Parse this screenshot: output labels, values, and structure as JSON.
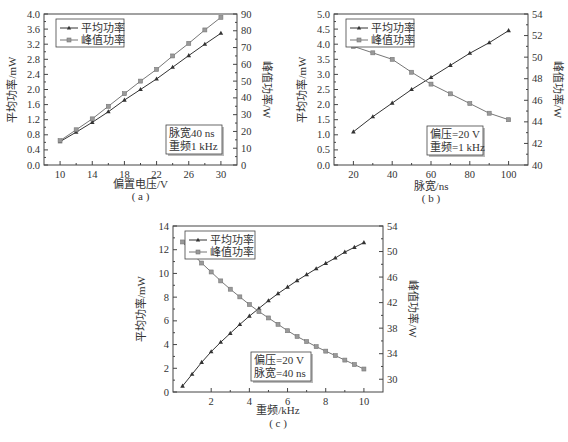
{
  "chart_data": [
    {
      "id": "a",
      "type": "line",
      "caption": "( a )",
      "xlabel": "偏置电压/V",
      "ylabel_left": "平均功率/mW",
      "ylabel_right": "峰值功率/W",
      "xlim": [
        8,
        32
      ],
      "xticks": [
        10,
        14,
        18,
        22,
        26,
        30
      ],
      "ylim_left": [
        0,
        4.0
      ],
      "yticks_left": [
        0.0,
        0.4,
        0.8,
        1.2,
        1.6,
        2.0,
        2.4,
        2.8,
        3.2,
        3.6,
        4.0
      ],
      "ylim_right": [
        0,
        90
      ],
      "yticks_right": [
        0,
        10,
        20,
        30,
        40,
        50,
        60,
        70,
        80,
        90
      ],
      "x": [
        10,
        12,
        14,
        16,
        18,
        20,
        22,
        24,
        26,
        28,
        30
      ],
      "series": [
        {
          "name": "平均功率",
          "axis": "left",
          "marker": "triangle",
          "values": [
            0.62,
            0.87,
            1.13,
            1.41,
            1.72,
            2.0,
            2.28,
            2.59,
            2.9,
            3.2,
            3.49
          ]
        },
        {
          "name": "峰值功率",
          "axis": "right",
          "marker": "square-x",
          "values": [
            14.5,
            21.0,
            27.5,
            35.0,
            42.5,
            50.0,
            57.0,
            65.0,
            72.5,
            80.5,
            88.0
          ]
        }
      ],
      "legend": [
        "平均功率",
        "峰值功率"
      ],
      "legend_position": "upper left",
      "annotation": [
        "脉宽40 ns",
        "重频1 kHz"
      ],
      "grid": false
    },
    {
      "id": "b",
      "type": "line",
      "caption": "( b )",
      "xlabel": "脉宽/ns",
      "ylabel_left": "平均功率/mW",
      "ylabel_right": "峰值功率/W",
      "xlim": [
        10,
        110
      ],
      "xticks": [
        20,
        40,
        60,
        80,
        100
      ],
      "ylim_left": [
        0,
        5.0
      ],
      "yticks_left": [
        0.0,
        0.5,
        1.0,
        1.5,
        2.0,
        2.5,
        3.0,
        3.5,
        4.0,
        4.5,
        5.0
      ],
      "ylim_right": [
        40,
        54
      ],
      "yticks_right": [
        40,
        42,
        44,
        46,
        48,
        50,
        52,
        54
      ],
      "x": [
        20,
        30,
        40,
        50,
        60,
        70,
        80,
        90,
        100
      ],
      "series": [
        {
          "name": "平均功率",
          "axis": "left",
          "marker": "triangle",
          "values": [
            1.1,
            1.6,
            2.05,
            2.5,
            2.9,
            3.3,
            3.7,
            4.05,
            4.45
          ]
        },
        {
          "name": "峰值功率",
          "axis": "right",
          "marker": "square-x",
          "values": [
            51.0,
            50.4,
            49.8,
            48.6,
            47.5,
            46.6,
            45.7,
            44.8,
            44.2
          ]
        }
      ],
      "legend": [
        "平均功率",
        "峰值功率"
      ],
      "legend_position": "upper left",
      "annotation": [
        "偏压=20 V",
        "重频=1 kHz"
      ],
      "grid": false
    },
    {
      "id": "c",
      "type": "line",
      "caption": "( c )",
      "xlabel": "重频/kHz",
      "ylabel_left": "平均功率/mW",
      "ylabel_right": "峰值功率/W",
      "xlim": [
        0,
        11
      ],
      "xticks": [
        2,
        4,
        6,
        8,
        10
      ],
      "ylim_left": [
        0,
        14
      ],
      "yticks_left": [
        0,
        2,
        4,
        6,
        8,
        10,
        12,
        14
      ],
      "ylim_right": [
        28,
        54
      ],
      "yticks_right": [
        30,
        34,
        38,
        42,
        46,
        50,
        54
      ],
      "x": [
        0.5,
        1.0,
        1.5,
        2.0,
        2.5,
        3.0,
        3.5,
        4.0,
        4.5,
        5.0,
        5.5,
        6.0,
        6.5,
        7.0,
        7.5,
        8.0,
        8.5,
        9.0,
        9.5,
        10.0
      ],
      "series": [
        {
          "name": "平均功率",
          "axis": "left",
          "marker": "triangle",
          "values": [
            0.5,
            1.5,
            2.5,
            3.4,
            4.2,
            4.95,
            5.7,
            6.4,
            7.05,
            7.7,
            8.3,
            8.85,
            9.4,
            9.9,
            10.4,
            10.85,
            11.3,
            11.8,
            12.2,
            12.6
          ]
        },
        {
          "name": "峰值功率",
          "axis": "right",
          "marker": "square-x",
          "values": [
            51.5,
            49.7,
            48.2,
            46.8,
            45.4,
            44.1,
            42.9,
            41.7,
            40.6,
            39.6,
            38.6,
            37.6,
            36.7,
            35.9,
            35.1,
            34.4,
            33.7,
            33.0,
            32.3,
            31.6
          ]
        }
      ],
      "legend": [
        "平均功率",
        "峰值功率"
      ],
      "legend_position": "upper left",
      "annotation": [
        "偏压=20 V",
        "脉宽=40 ns"
      ],
      "grid": false
    }
  ],
  "layout": {
    "line_color_avg": "#333333",
    "line_color_peak": "#777777",
    "axis_color": "#444444",
    "frame_color": "#888888"
  }
}
